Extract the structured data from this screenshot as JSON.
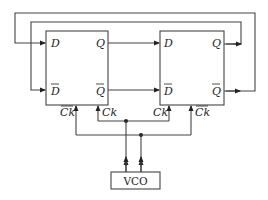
{
  "diagram": {
    "type": "circuit",
    "flipflops": [
      {
        "id": "ff1",
        "inputs": {
          "d": "D",
          "d_bar": "D",
          "ck_bar": "Ck",
          "ck": "Ck"
        },
        "outputs": {
          "q": "Q",
          "q_bar": "Q"
        }
      },
      {
        "id": "ff2",
        "inputs": {
          "d": "D",
          "d_bar": "D",
          "ck": "Ck",
          "ck_bar": "Ck"
        },
        "outputs": {
          "q": "Q",
          "q_bar": "Q"
        }
      }
    ],
    "oscillator": {
      "label": "VCO"
    },
    "connections": [
      "FF1.Q -> FF2.D",
      "FF1.Qbar -> FF2.Dbar",
      "FF2.Q -> FF1.Dbar (feedback, inner loop)",
      "FF2.Qbar -> FF1.D (feedback, outer loop)",
      "VCO out1 -> FF1.Ck, FF2.Ck",
      "VCO out2 -> FF1.Ckbar, FF2.Ckbar"
    ],
    "colors": {
      "line": "#444444",
      "background": "#ffffff"
    }
  }
}
